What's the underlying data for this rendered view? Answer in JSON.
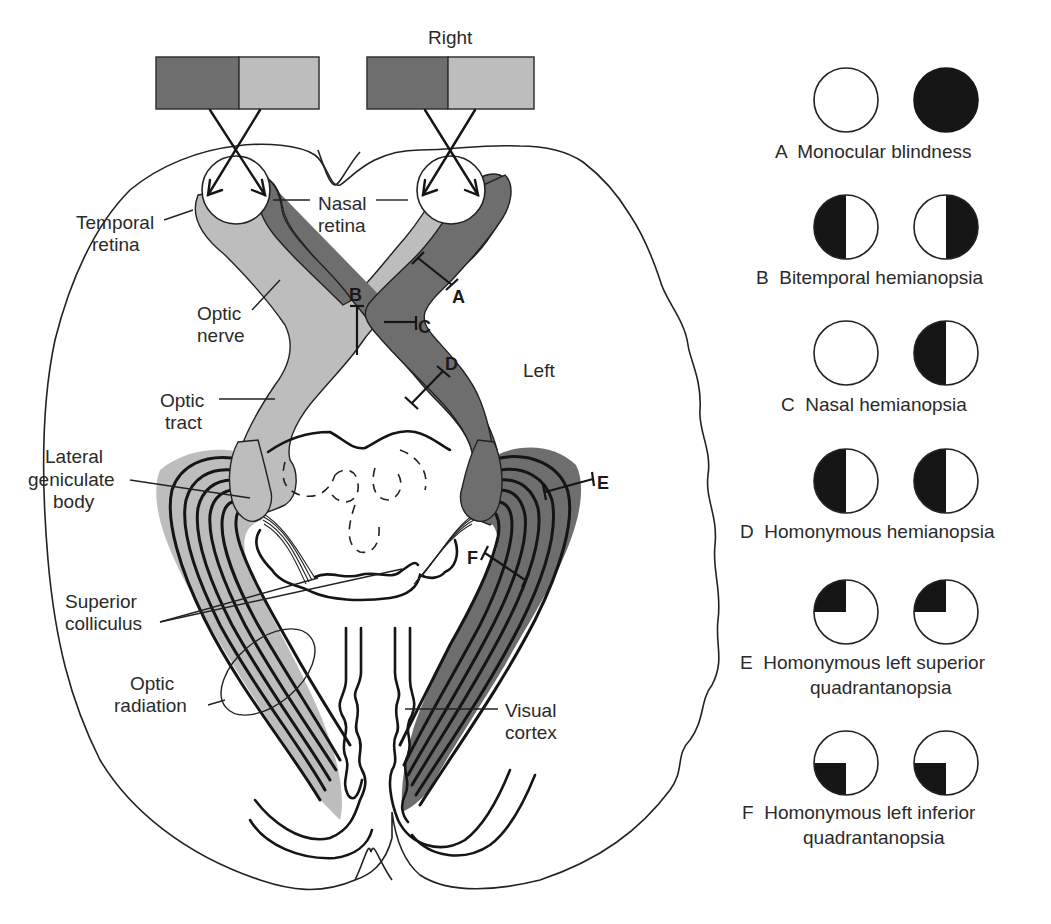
{
  "figure": {
    "orientation_label": "Right",
    "hemisphere_label": "Left",
    "colors": {
      "dark_gray": "#6e6e6e",
      "light_gray": "#bdbdbd",
      "black": "#161616",
      "outline": "#222222",
      "background": "#ffffff"
    },
    "visual_fields": [
      {
        "side": "left-eye-field",
        "temporal_shade": "dark",
        "nasal_shade": "light"
      },
      {
        "side": "right-eye-field",
        "temporal_shade": "dark",
        "nasal_shade": "light"
      }
    ],
    "anatomy_labels": {
      "temporal_retina": [
        "Temporal",
        "retina"
      ],
      "nasal_retina": [
        "Nasal",
        "retina"
      ],
      "optic_nerve": [
        "Optic",
        "nerve"
      ],
      "optic_tract": [
        "Optic",
        "tract"
      ],
      "lateral_geniculate_body": [
        "Lateral",
        "geniculate",
        "body"
      ],
      "superior_colliculus": [
        "Superior",
        "colliculus"
      ],
      "optic_radiation": [
        "Optic",
        "radiation"
      ],
      "visual_cortex": [
        "Visual",
        "cortex"
      ]
    },
    "lesion_markers": [
      "A",
      "B",
      "C",
      "D",
      "E",
      "F"
    ]
  },
  "legend": {
    "items": [
      {
        "letter": "A",
        "lines": [
          "A  Monocular blindness"
        ],
        "left_field": "none",
        "right_field": "full"
      },
      {
        "letter": "B",
        "lines": [
          "B  Bitemporal hemianopsia"
        ],
        "left_field": "left-half",
        "right_field": "right-half"
      },
      {
        "letter": "C",
        "lines": [
          "C  Nasal hemianopsia"
        ],
        "left_field": "none",
        "right_field": "left-half"
      },
      {
        "letter": "D",
        "lines": [
          "D  Homonymous hemianopsia"
        ],
        "left_field": "left-half",
        "right_field": "left-half"
      },
      {
        "letter": "E",
        "lines": [
          "E  Homonymous left superior",
          "quadrantanopsia"
        ],
        "left_field": "upper-left-quadrant",
        "right_field": "upper-left-quadrant"
      },
      {
        "letter": "F",
        "lines": [
          "F  Homonymous left inferior",
          "quadrantanopsia"
        ],
        "left_field": "lower-left-quadrant",
        "right_field": "lower-left-quadrant"
      }
    ]
  }
}
